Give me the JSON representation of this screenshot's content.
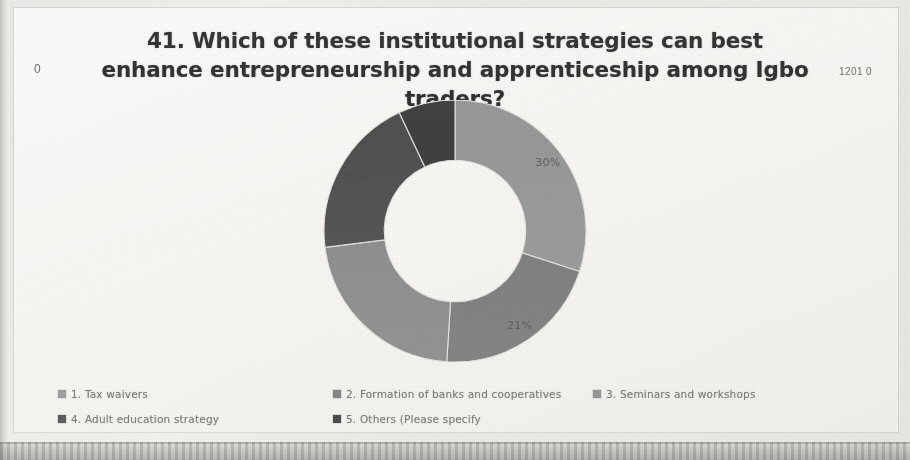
{
  "slide": {
    "marker_left": "0",
    "marker_right": "1201 0",
    "title": "41. Which of these institutional strategies can best enhance entrepreneurship and apprenticeship among Igbo traders?"
  },
  "legend": {
    "items": [
      {
        "label": "1. Tax waivers",
        "color": "#9a9a9a"
      },
      {
        "label": "2. Formation of banks and cooperatives",
        "color": "#7d7d7d"
      },
      {
        "label": "3. Seminars and workshops",
        "color": "#8e8e8e"
      },
      {
        "label": "4. Adult education strategy",
        "color": "#4f4f4f"
      },
      {
        "label": "5. Others (Please specify",
        "color": "#3c3c3c"
      }
    ]
  },
  "chart_data": {
    "type": "pie",
    "variant": "donut",
    "title": "41. Which of these institutional strategies can best enhance entrepreneurship and apprenticeship among Igbo traders?",
    "categories": [
      "1. Tax waivers",
      "2. Formation of banks and cooperatives",
      "3. Seminars and workshops",
      "4. Adult education strategy",
      "5. Others (Please specify"
    ],
    "values": [
      30,
      21,
      22,
      20,
      7
    ],
    "value_labels": [
      "30%",
      "21%",
      "22%",
      "20%",
      ""
    ],
    "colors": [
      "#9a9a9a",
      "#7d7d7d",
      "#8e8e8e",
      "#4f4f4f",
      "#3c3c3c"
    ],
    "units": "percent",
    "start_angle_deg": 0,
    "direction": "clockwise",
    "inner_radius_ratio": 0.54,
    "legend": "bottom",
    "grid": false,
    "visible_labels": [
      "30%",
      "21%",
      "20%"
    ]
  }
}
